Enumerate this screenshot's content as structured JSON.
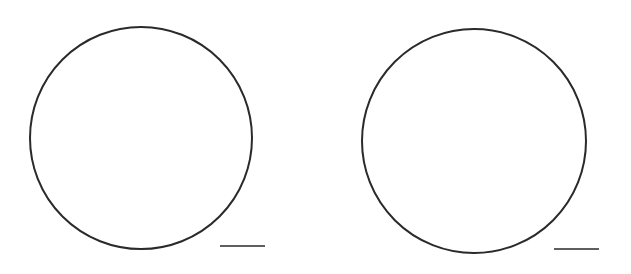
{
  "figure": {
    "background": "#ffffff",
    "stroke_color": "#2a2a2a",
    "panels": [
      {
        "name": "left-panel",
        "circle": {
          "cx": 141,
          "cy": 138,
          "r": 111
        },
        "scale_bar": {
          "x1": 220,
          "x2": 265,
          "y": 246
        }
      },
      {
        "name": "right-panel",
        "circle": {
          "cx": 474,
          "cy": 141,
          "r": 112
        },
        "scale_bar": {
          "x1": 554,
          "x2": 599,
          "y": 249
        }
      }
    ]
  }
}
